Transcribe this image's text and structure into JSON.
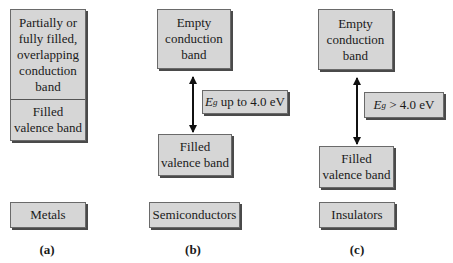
{
  "figure": {
    "columns": [
      {
        "id": "a",
        "material": "Metals",
        "caption": "(a)",
        "upper_band": "Partially or\nfully filled,\noverlapping\nconduction\nband",
        "lower_band": "Filled\nvalence band"
      },
      {
        "id": "b",
        "material": "Semiconductors",
        "caption": "(b)",
        "upper_band": "Empty\nconduction\nband",
        "lower_band": "Filled\nvalence band",
        "gap_symbol": "E",
        "gap_subscript": "g",
        "gap_text": " up to 4.0 eV"
      },
      {
        "id": "c",
        "material": "Insulators",
        "caption": "(c)",
        "upper_band": "Empty\nconduction\nband",
        "lower_band": "Filled\nvalence band",
        "gap_symbol": "E",
        "gap_subscript": "g",
        "gap_text": " > 4.0 eV"
      }
    ]
  },
  "colors": {
    "box_fill": "#d6d6d6",
    "box_shadow": "#4a4a4a",
    "arrow": "#111111"
  }
}
